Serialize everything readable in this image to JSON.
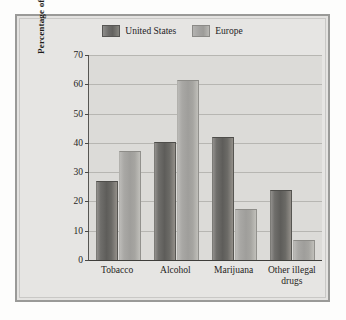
{
  "chart_data": {
    "type": "bar",
    "title": "",
    "subtitle": "",
    "xlabel": "",
    "ylabel": "Percentage of Tenth-Grade Students",
    "ylim": [
      0,
      70
    ],
    "ytick_step": 10,
    "yticks": [
      70,
      60,
      50,
      40,
      30,
      20,
      10,
      0
    ],
    "grid": true,
    "legend_position": "top-center",
    "categories": [
      "Tobacco",
      "Alcohol",
      "Marijuana",
      "Other illegal drugs"
    ],
    "category_lines": [
      [
        "Tobacco"
      ],
      [
        "Alcohol"
      ],
      [
        "Marijuana"
      ],
      [
        "Other illegal",
        "drugs"
      ]
    ],
    "series": [
      {
        "name": "United States",
        "color": "#64635F",
        "values": [
          26.5,
          40.0,
          41.5,
          23.5
        ]
      },
      {
        "name": "Europe",
        "color": "#A3A29F",
        "values": [
          37.0,
          61.0,
          17.0,
          6.5
        ]
      }
    ]
  },
  "legend": {
    "entries": [
      {
        "label": "United States",
        "swatch": "legend-swatch-us"
      },
      {
        "label": "Europe",
        "swatch": "legend-swatch-europe"
      }
    ]
  },
  "colors": {
    "page_background": "#FDFDFC",
    "frame_border": "#9A9A98",
    "panel_background": "#E6E5E3",
    "plot_background": "#DCDBD8",
    "gridline": "#B7B6B2",
    "axis": "#3F3E3B",
    "text": "#1F1E1B"
  }
}
